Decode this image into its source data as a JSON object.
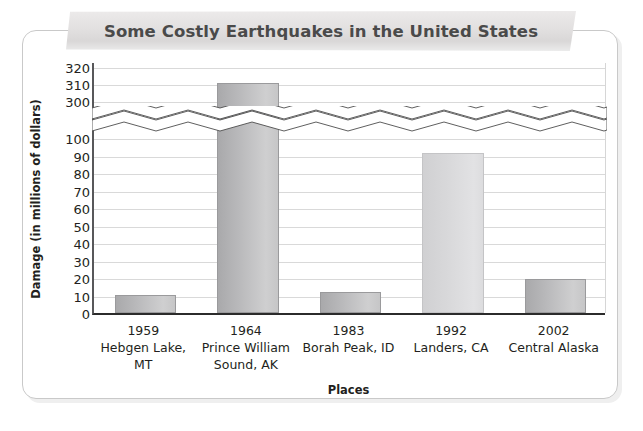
{
  "title": "Some Costly Earthquakes in the United States",
  "chart_data": {
    "type": "bar",
    "title": "Some Costly Earthquakes in the United States",
    "xlabel": "Places",
    "ylabel": "Damage (in millions of dollars)",
    "categories": [
      "1959\nHebgen Lake, MT",
      "1964\nPrince William Sound, AK",
      "1983\nBorah Peak, ID",
      "1992\nLanders, CA",
      "2002\nCentral Alaska"
    ],
    "years": [
      "1959",
      "1964",
      "1983",
      "1992",
      "2002"
    ],
    "places": [
      "Hebgen Lake, MT",
      "Prince William Sound, AK",
      "Borah Peak, ID",
      "Landers, CA",
      "Central Alaska"
    ],
    "values": [
      11,
      311,
      13,
      92,
      20
    ],
    "ytick_labels": [
      "320",
      "310",
      "300",
      "100",
      "90",
      "80",
      "70",
      "60",
      "50",
      "40",
      "30",
      "20",
      "10",
      "0"
    ],
    "ylim": [
      0,
      320
    ],
    "axis_break": true,
    "axis_break_between": [
      100,
      300
    ],
    "grid": true,
    "legend": null,
    "bar_color_dark": "#b5b5b7",
    "bar_color_light": "#d8d8da"
  },
  "bars": [
    {
      "year": "1959",
      "place": "Hebgen Lake, MT",
      "value": 11,
      "shade": "dark"
    },
    {
      "year": "1964",
      "place": "Prince William Sound, AK",
      "value": 311,
      "shade": "dark"
    },
    {
      "year": "1983",
      "place": "Borah Peak, ID",
      "value": 13,
      "shade": "dark"
    },
    {
      "year": "1992",
      "place": "Landers, CA",
      "value": 92,
      "shade": "light"
    },
    {
      "year": "2002",
      "place": "Central Alaska",
      "value": 20,
      "shade": "dark"
    }
  ],
  "y_axis": {
    "title": "Damage (in millions of dollars)",
    "ticks": [
      {
        "label": "320",
        "y": 68
      },
      {
        "label": "310",
        "y": 85
      },
      {
        "label": "300",
        "y": 102
      },
      {
        "label": "100",
        "y": 139
      },
      {
        "label": "90",
        "y": 157
      },
      {
        "label": "80",
        "y": 174
      },
      {
        "label": "70",
        "y": 192
      },
      {
        "label": "60",
        "y": 209
      },
      {
        "label": "50",
        "y": 227
      },
      {
        "label": "40",
        "y": 244
      },
      {
        "label": "30",
        "y": 262
      },
      {
        "label": "20",
        "y": 279
      },
      {
        "label": "10",
        "y": 297
      },
      {
        "label": "0",
        "y": 314
      }
    ]
  },
  "x_axis": {
    "title": "Places",
    "labels": [
      {
        "year": "1959",
        "place": "Hebgen Lake, MT"
      },
      {
        "year": "1964",
        "place": "Prince William Sound, AK"
      },
      {
        "year": "1983",
        "place": "Borah Peak, ID"
      },
      {
        "year": "1992",
        "place": "Landers, CA"
      },
      {
        "year": "2002",
        "place": "Central Alaska"
      }
    ]
  },
  "colors": {
    "title_text": "#4a4a4a",
    "banner": "#e2e0e0",
    "axis": "#2b2b2b",
    "grid": "#d9d9d9",
    "panel_border": "#c9c9c9"
  }
}
